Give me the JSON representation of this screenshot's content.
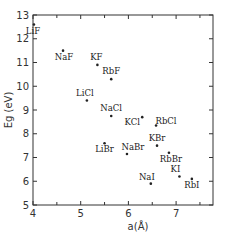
{
  "chart_data": {
    "type": "scatter",
    "title": "",
    "xlabel": "a(Å)",
    "ylabel": "Eg (eV)",
    "xlim": [
      4,
      7.75
    ],
    "ylim": [
      5,
      13
    ],
    "x_ticks": [
      "4",
      "5",
      "6",
      "7"
    ],
    "y_ticks": [
      "5",
      "6",
      "7",
      "8",
      "9",
      "10",
      "11",
      "12",
      "13"
    ],
    "grid": false,
    "legend": null,
    "points": [
      {
        "label": "LiF",
        "x": 4.02,
        "y": 12.6
      },
      {
        "label": "NaF",
        "x": 4.63,
        "y": 11.5
      },
      {
        "label": "KF",
        "x": 5.35,
        "y": 10.9
      },
      {
        "label": "RbF",
        "x": 5.64,
        "y": 10.3
      },
      {
        "label": "LiCl",
        "x": 5.13,
        "y": 9.4
      },
      {
        "label": "NaCl",
        "x": 5.64,
        "y": 8.75
      },
      {
        "label": "KCl",
        "x": 6.29,
        "y": 8.7
      },
      {
        "label": "RbCl",
        "x": 6.58,
        "y": 8.35
      },
      {
        "label": "LiBr",
        "x": 5.5,
        "y": 7.6
      },
      {
        "label": "NaBr",
        "x": 5.97,
        "y": 7.15
      },
      {
        "label": "KBr",
        "x": 6.6,
        "y": 7.5
      },
      {
        "label": "RbBr",
        "x": 6.85,
        "y": 7.2
      },
      {
        "label": "NaI",
        "x": 6.47,
        "y": 5.9
      },
      {
        "label": "KI",
        "x": 7.07,
        "y": 6.2
      },
      {
        "label": "RbI",
        "x": 7.33,
        "y": 6.1
      }
    ]
  }
}
